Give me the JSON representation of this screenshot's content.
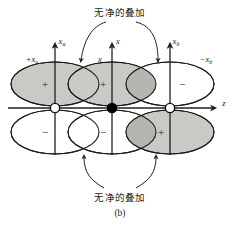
{
  "figure": {
    "panel_label": "(b)",
    "annotations": {
      "top_text": "无净的叠加",
      "bottom_text": "无净的叠加"
    },
    "axes": {
      "horizontal": {
        "label": "z"
      },
      "vertical": [
        {
          "label": "x",
          "sub": "a"
        },
        {
          "label": "x",
          "sub": ""
        },
        {
          "label": "x",
          "sub": "b"
        }
      ]
    },
    "orbital_labels": [
      {
        "text": "+x",
        "sub": "a"
      },
      {
        "text": "x",
        "sub": ""
      },
      {
        "text": "−x",
        "sub": "b"
      }
    ],
    "lobes": [
      {
        "id": "left-upper",
        "sign": "+",
        "fill": "shaded"
      },
      {
        "id": "center-upper",
        "sign": "+",
        "fill": "shaded"
      },
      {
        "id": "right-upper",
        "sign": "−",
        "fill": "open"
      },
      {
        "id": "left-lower",
        "sign": "−",
        "fill": "open"
      },
      {
        "id": "center-lower",
        "sign": "−",
        "fill": "open"
      },
      {
        "id": "right-lower",
        "sign": "+",
        "fill": "shaded"
      }
    ],
    "nuclei": [
      {
        "id": "nucleus-a",
        "style": "open"
      },
      {
        "id": "nucleus-center",
        "style": "filled"
      },
      {
        "id": "nucleus-b",
        "style": "open"
      }
    ],
    "colors": {
      "shaded_lobe": "#c9c9c5",
      "overlap": "#b6b6b1",
      "outline": "#1a1a1a",
      "text": "#231f20",
      "background": "#ffffff"
    }
  }
}
